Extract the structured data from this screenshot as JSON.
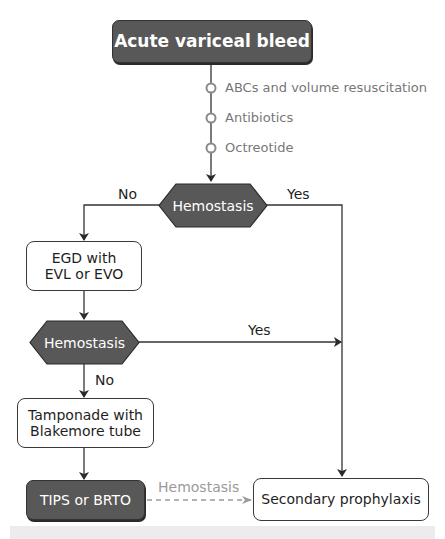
{
  "diagram": {
    "title_node": "Acute variceal bleed",
    "initial_steps": [
      "ABCs and volume resuscitation",
      "Antibiotics",
      "Octreotide"
    ],
    "decision_1": {
      "label": "Hemostasis",
      "no_label": "No",
      "yes_label": "Yes"
    },
    "egd_node": {
      "line1": "EGD with",
      "line2": "EVL or EVO"
    },
    "decision_2": {
      "label": "Hemostasis",
      "yes_label": "Yes",
      "no_label": "No"
    },
    "tamponade_node": {
      "line1": "Tamponade with",
      "line2": "Blakemore tube"
    },
    "tips_node": "TIPS or BRTO",
    "tips_edge_label": "Hemostasis",
    "outcome_node": "Secondary prophylaxis",
    "colors": {
      "dark_fill": "#585858",
      "line": "#333333",
      "step_circle": "#8a8a8a",
      "dashed_edge": "#9a9a9a"
    }
  }
}
